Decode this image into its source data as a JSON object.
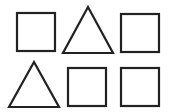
{
  "diagram": {
    "stroke_color": "#222222",
    "fill_color": "#ffffff",
    "rows": [
      {
        "shapes": [
          {
            "type": "square",
            "x": 17,
            "y": 13,
            "size": 38
          },
          {
            "type": "triangle",
            "points": "88,7 63,53 113,53"
          },
          {
            "type": "square",
            "x": 121,
            "y": 14,
            "size": 38
          }
        ]
      },
      {
        "shapes": [
          {
            "type": "triangle",
            "points": "34,62 9,107 59,107"
          },
          {
            "type": "square",
            "x": 68,
            "y": 68,
            "size": 38
          },
          {
            "type": "square",
            "x": 121,
            "y": 68,
            "size": 38
          }
        ]
      }
    ]
  }
}
